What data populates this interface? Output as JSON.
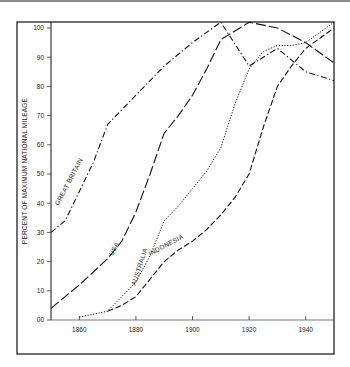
{
  "chart_data": {
    "type": "line",
    "title": "",
    "xlabel": "",
    "ylabel": "PERCENT OF MAXIMUM NATIONAL MILEAGE",
    "xlim": [
      1850,
      1950
    ],
    "ylim": [
      0,
      100
    ],
    "x_ticks": [
      1860,
      1880,
      1900,
      1920,
      1940
    ],
    "y_ticks": [
      0,
      10,
      20,
      30,
      40,
      50,
      60,
      70,
      80,
      90,
      100
    ],
    "y_tick_labels": [
      "00",
      "10",
      "20",
      "30",
      "40",
      "50",
      "60",
      "70",
      "80",
      "90",
      "100"
    ],
    "grid": false,
    "legend": "inline labels along curves",
    "series": [
      {
        "name": "GREAT BRITAIN",
        "style": "dash-dot",
        "x": [
          1850,
          1855,
          1860,
          1865,
          1870,
          1880,
          1890,
          1900,
          1910,
          1920,
          1925,
          1930,
          1940,
          1950
        ],
        "values": [
          30,
          34,
          44,
          54,
          67,
          77,
          87,
          95,
          102,
          87,
          90,
          93,
          85,
          82
        ],
        "label_pos": {
          "x": 1857,
          "y": 47,
          "angle": -62
        }
      },
      {
        "name": "USA",
        "style": "long-dash",
        "x": [
          1850,
          1860,
          1870,
          1875,
          1880,
          1885,
          1890,
          1895,
          1900,
          1905,
          1910,
          1920,
          1930,
          1940,
          1950
        ],
        "values": [
          4,
          12,
          21,
          27,
          37,
          50,
          64,
          70,
          77,
          86,
          96,
          102,
          100,
          95,
          88
        ],
        "label_pos": {
          "x": 1873,
          "y": 24,
          "angle": -62
        }
      },
      {
        "name": "AUSTRALIA",
        "style": "dotted",
        "x": [
          1860,
          1870,
          1875,
          1880,
          1885,
          1890,
          1895,
          1900,
          1905,
          1910,
          1915,
          1920,
          1925,
          1930,
          1935,
          1940,
          1950
        ],
        "values": [
          1,
          3,
          8,
          13,
          22,
          34,
          39,
          45,
          51,
          59,
          74,
          86,
          92,
          94,
          94,
          95,
          102
        ],
        "label_pos": {
          "x": 1882,
          "y": 18,
          "angle": -72
        }
      },
      {
        "name": "INDONESIA",
        "style": "dashed",
        "x": [
          1870,
          1875,
          1880,
          1885,
          1890,
          1895,
          1900,
          1905,
          1910,
          1915,
          1920,
          1925,
          1930,
          1935,
          1940,
          1950
        ],
        "values": [
          3,
          5,
          8,
          14,
          20,
          24,
          27,
          31,
          36,
          42,
          50,
          66,
          80,
          87,
          93,
          100
        ],
        "label_pos": {
          "x": 1891,
          "y": 25,
          "angle": -28
        }
      }
    ]
  }
}
